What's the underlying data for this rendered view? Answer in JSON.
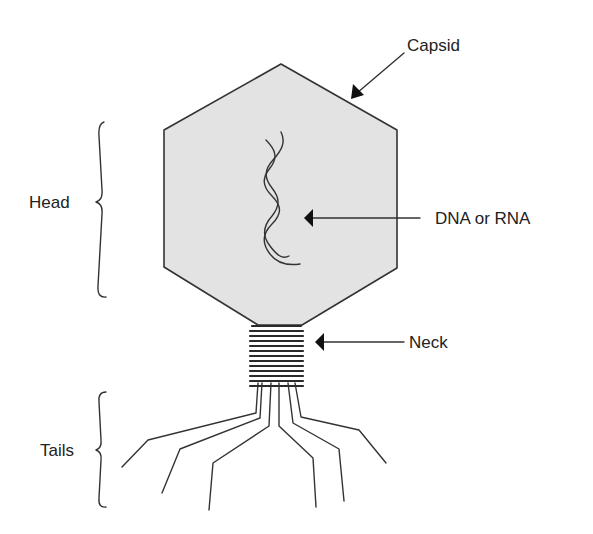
{
  "diagram": {
    "labels": {
      "capsid": "Capsid",
      "dna": "DNA or RNA",
      "neck": "Neck",
      "head": "Head",
      "tails": "Tails"
    },
    "colors": {
      "capsid_fill": "#e3e3e3",
      "stroke": "#333333",
      "text": "#222222",
      "background": "#ffffff"
    },
    "parts": [
      "capsid",
      "nucleic-acid",
      "neck",
      "tail-fibers"
    ],
    "brackets": [
      "Head",
      "Tails"
    ],
    "neck_rings": 13,
    "tail_fibers": 6
  }
}
